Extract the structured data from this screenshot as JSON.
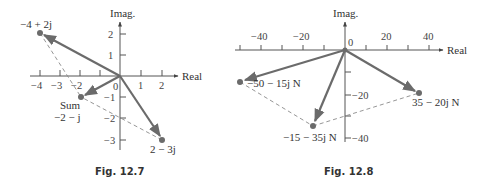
{
  "figures": [
    {
      "caption": "Fig. 12.7",
      "axes": {
        "x_label": "Real",
        "y_label": "Imag.",
        "origin_label": "0",
        "x_ticks": [
          "−4",
          "−3",
          "−2",
          "1",
          "2"
        ],
        "y_ticks": [
          "2",
          "1",
          "−1",
          "−2",
          "−3"
        ]
      },
      "vectors": [
        {
          "label": "−4 + 2j",
          "re": -4,
          "im": 2
        },
        {
          "label": "2 − 3j",
          "re": 2,
          "im": -3
        },
        {
          "label": "−2 − j",
          "re": -2,
          "im": -1,
          "note": "Sum"
        }
      ],
      "sum_label": "Sum"
    },
    {
      "caption": "Fig. 12.8",
      "axes": {
        "x_label": "Real",
        "y_label": "Imag.",
        "origin_label": "0",
        "x_ticks": [
          "−40",
          "−20",
          "20",
          "40"
        ],
        "y_ticks": [
          "−20",
          "−40"
        ]
      },
      "vectors": [
        {
          "label": "−50 − 15j N",
          "re": -50,
          "im": -15
        },
        {
          "label": "35 − 20j N",
          "re": 35,
          "im": -20
        },
        {
          "label": "−15 − 35j N",
          "re": -15,
          "im": -35
        }
      ]
    }
  ],
  "colors": {
    "vector": "#6b6b6b",
    "axis": "#555555",
    "dashed": "#8a8a8a",
    "point": "#6b6b6b"
  }
}
